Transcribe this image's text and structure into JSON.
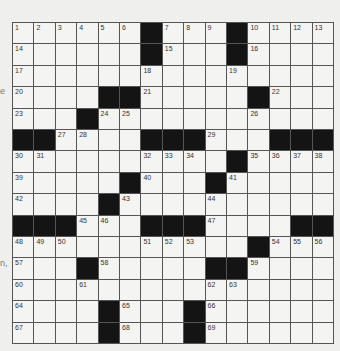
{
  "puzzle": {
    "rows": 15,
    "cols": 15,
    "colors": {
      "black": "#141414",
      "white": "#f4f4f2",
      "line": "#555555"
    },
    "grid": [
      [
        "1",
        "2",
        "3",
        "4",
        "5",
        "6",
        "#",
        "7",
        "8",
        "9",
        "#",
        "10",
        "11",
        "12",
        "13"
      ],
      [
        "14",
        "",
        "",
        "",
        "",
        "",
        "#",
        "15",
        "",
        "",
        "#",
        "16",
        "",
        "",
        ""
      ],
      [
        "17",
        "",
        "",
        "",
        "",
        "",
        "18",
        "",
        "",
        "",
        "19",
        "",
        "",
        "",
        ""
      ],
      [
        "20",
        "",
        "",
        "",
        "#",
        "#",
        "21",
        "",
        "",
        "",
        "",
        "#",
        "22",
        "",
        ""
      ],
      [
        "23",
        "",
        "",
        "#",
        "24",
        "25",
        "",
        "",
        "",
        "",
        "",
        "26",
        "",
        "",
        ""
      ],
      [
        "#",
        "#",
        "27",
        "28",
        "",
        "",
        "#",
        "#",
        "#",
        "29",
        "",
        "",
        "#",
        "#",
        "#"
      ],
      [
        "30",
        "31",
        "",
        "",
        "",
        "",
        "32",
        "33",
        "34",
        "",
        "#",
        "35",
        "36",
        "37",
        "38"
      ],
      [
        "39",
        "",
        "",
        "",
        "",
        "#",
        "40",
        "",
        "",
        "#",
        "41",
        "",
        "",
        "",
        ""
      ],
      [
        "42",
        "",
        "",
        "",
        "#",
        "43",
        "",
        "",
        "",
        "44",
        "",
        "",
        "",
        "",
        ""
      ],
      [
        "#",
        "#",
        "#",
        "45",
        "46",
        "",
        "#",
        "#",
        "#",
        "47",
        "",
        "",
        "",
        "#",
        "#"
      ],
      [
        "48",
        "49",
        "50",
        "",
        "",
        "",
        "51",
        "52",
        "53",
        "",
        "",
        "#",
        "54",
        "55",
        "56"
      ],
      [
        "57",
        "",
        "",
        "#",
        "58",
        "",
        "",
        "",
        "",
        "#",
        "#",
        "59",
        "",
        "",
        ""
      ],
      [
        "60",
        "",
        "",
        "61",
        "",
        "",
        "",
        "",
        "",
        "62",
        "63",
        "",
        "",
        "",
        ""
      ],
      [
        "64",
        "",
        "",
        "",
        "#",
        "65",
        "",
        "",
        "#",
        "66",
        "",
        "",
        "",
        "",
        ""
      ],
      [
        "67",
        "",
        "",
        "",
        "#",
        "68",
        "",
        "",
        "#",
        "69",
        "",
        "",
        "",
        "",
        ""
      ]
    ]
  },
  "edge_fragments": [
    {
      "text": "e"
    },
    {
      "text": "n,"
    }
  ]
}
